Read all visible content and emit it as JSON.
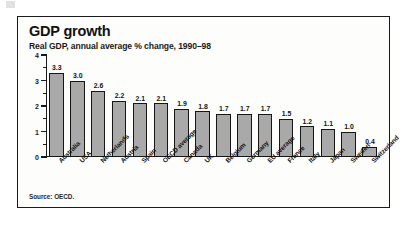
{
  "figure": {
    "title": "GDP growth",
    "subtitle": "Real GDP, annual average % change, 1990–98",
    "source": "Source: OECD."
  },
  "chart_data": {
    "type": "bar",
    "title": "GDP growth",
    "subtitle": "Real GDP, annual average % change, 1990–98",
    "xlabel": "",
    "ylabel": "",
    "ylim": [
      0,
      4
    ],
    "yticks": [
      0,
      1,
      2,
      3,
      4
    ],
    "ytick_labels": [
      "0",
      "1",
      "2",
      "3",
      "4"
    ],
    "minor_ticks": [
      0.5,
      1.5,
      2.5,
      3.5
    ],
    "grid": false,
    "legend": "none",
    "bar_color": "#a9a9a9",
    "bar_edge_color": "#161616",
    "value_label_format": "one-decimal",
    "orientation": "vertical",
    "sorted": "descending",
    "source": "Source: OECD.",
    "categories": [
      "Australia",
      "USA",
      "Netherlands",
      "Austria",
      "Spain",
      "OECD average",
      "Canada",
      "UK",
      "Belgium",
      "Germany",
      "EU average",
      "France",
      "Italy",
      "Japan",
      "Sweden",
      "Switzerland"
    ],
    "values": [
      3.3,
      3.0,
      2.6,
      2.2,
      2.1,
      2.1,
      1.9,
      1.8,
      1.7,
      1.7,
      1.7,
      1.5,
      1.2,
      1.1,
      1.0,
      0.4
    ],
    "value_labels": [
      "3.3",
      "3.0",
      "2.6",
      "2.2",
      "2.1",
      "2.1",
      "1.9",
      "1.8",
      "1.7",
      "1.7",
      "1.7",
      "1.5",
      "1.2",
      "1.1",
      "1.0",
      "0.4"
    ]
  }
}
